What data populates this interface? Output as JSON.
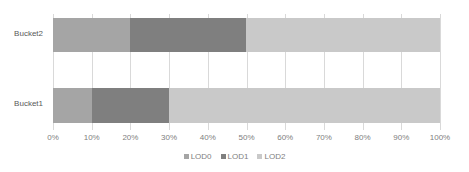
{
  "chart_data": {
    "type": "bar",
    "orientation": "horizontal",
    "stacked": "100%",
    "title": "",
    "xlabel": "",
    "ylabel": "",
    "xlim": [
      0,
      100
    ],
    "grid": true,
    "legend_position": "bottom",
    "categories": [
      "Bucket1",
      "Bucket2"
    ],
    "series": [
      {
        "name": "LOD0",
        "color": "#a5a5a5",
        "values": [
          10,
          20
        ]
      },
      {
        "name": "LOD1",
        "color": "#7f7f7f",
        "values": [
          20,
          30
        ]
      },
      {
        "name": "LOD2",
        "color": "#c9c9c9",
        "values": [
          70,
          50
        ]
      }
    ],
    "xticks": [
      "0%",
      "10%",
      "20%",
      "30%",
      "40%",
      "50%",
      "60%",
      "70%",
      "80%",
      "90%",
      "100%"
    ],
    "xtick_values": [
      0,
      10,
      20,
      30,
      40,
      50,
      60,
      70,
      80,
      90,
      100
    ]
  }
}
